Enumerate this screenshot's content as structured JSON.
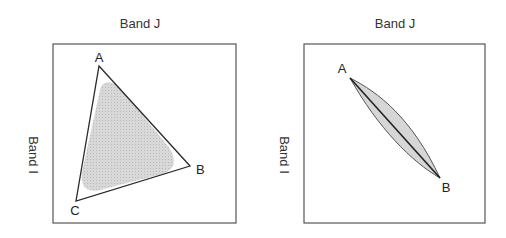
{
  "panels": [
    {
      "x_axis_label": "Band J",
      "y_axis_label": "Band I",
      "shape": "triangle",
      "vertices": [
        {
          "label": "A"
        },
        {
          "label": "B"
        },
        {
          "label": "C"
        }
      ]
    },
    {
      "x_axis_label": "Band J",
      "y_axis_label": "Band I",
      "shape": "line",
      "vertices": [
        {
          "label": "A"
        },
        {
          "label": "B"
        }
      ]
    }
  ],
  "colors": {
    "frame": "#555555",
    "edge": "#2a2a2a",
    "fill": "#cfcfcf"
  }
}
